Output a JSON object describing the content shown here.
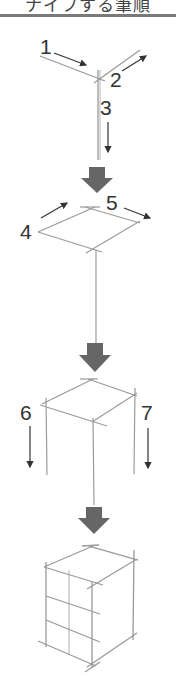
{
  "header": {
    "title": "ナイフする筆順"
  },
  "colors": {
    "pencil_line": "#9a9a9a",
    "label_text": "#333333",
    "step_arrow": "#666666",
    "header_rule": "#7a7a7a"
  },
  "steps": [
    {
      "stage": 1,
      "labels": [
        "1",
        "2",
        "3"
      ],
      "description": "Three strokes from a corner: left edge, right edge, vertical edge"
    },
    {
      "stage": 2,
      "labels": [
        "4",
        "5"
      ],
      "description": "Complete top face parallelogram"
    },
    {
      "stage": 3,
      "labels": [
        "6",
        "7"
      ],
      "description": "Draw side vertical edges downward"
    },
    {
      "stage": 4,
      "labels": [],
      "description": "Complete box with bottom edges and grid subdivisions"
    }
  ],
  "stroke_labels": {
    "s1": "1",
    "s2": "2",
    "s3": "3",
    "s4": "4",
    "s5": "5",
    "s6": "6",
    "s7": "7"
  }
}
